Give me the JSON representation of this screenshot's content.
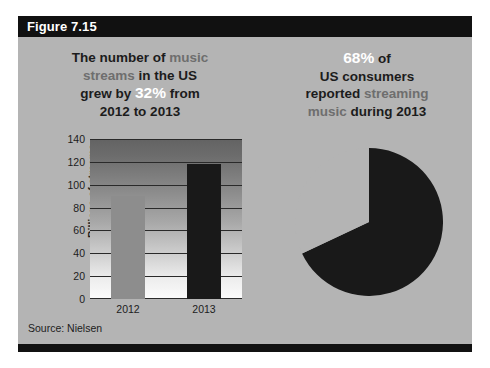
{
  "figure": {
    "label": "Figure 7.15",
    "source": "Source: Nielsen",
    "background_color": "#b4b4b4",
    "bar_color": "#111111"
  },
  "left_panel": {
    "headline_parts": [
      {
        "text": "The number of ",
        "style": "bold-dark"
      },
      {
        "text": "music",
        "style": "muted"
      },
      {
        "text": "streams",
        "style": "muted"
      },
      {
        "text": " in the US",
        "style": "bold-dark"
      },
      {
        "text": "grew by ",
        "style": "bold-dark"
      },
      {
        "text": "32%",
        "style": "white-big"
      },
      {
        "text": " from",
        "style": "bold-dark"
      },
      {
        "text": "2012 to 2013",
        "style": "bold-dark"
      }
    ],
    "headline_text": "The number of music streams in the US grew by 32% from 2012 to 2013",
    "highlight_value": "32%",
    "highlight_color": "#ffffff"
  },
  "right_panel": {
    "headline_parts": [
      {
        "text": "68%",
        "style": "white-big"
      },
      {
        "text": " of",
        "style": "bold-dark"
      },
      {
        "text": "US consumers",
        "style": "bold-dark"
      },
      {
        "text": "reported ",
        "style": "bold-dark"
      },
      {
        "text": "streaming",
        "style": "muted"
      },
      {
        "text": "music",
        "style": "muted"
      },
      {
        "text": " during 2013",
        "style": "bold-dark"
      }
    ],
    "headline_text": "68% of US consumers reported streaming music during 2013",
    "highlight_value": "68%",
    "highlight_color": "#ffffff"
  },
  "chart_data": [
    {
      "type": "bar",
      "title": "",
      "categories": [
        "2012",
        "2013"
      ],
      "values": [
        90,
        118
      ],
      "xlabel": "",
      "ylabel": "Billions of streams",
      "ylim": [
        0,
        140
      ],
      "yticks": [
        0,
        20,
        40,
        60,
        80,
        100,
        120,
        140
      ],
      "ytick_labels": [
        "0",
        "20",
        "40",
        "60",
        "80",
        "100",
        "120",
        "140"
      ],
      "grid": true,
      "legend": "none",
      "series_colors": [
        "#8d8d8d",
        "#191919"
      ],
      "plot_background": "vertical-gradient-dark-to-white",
      "source": "Source: Nielsen"
    },
    {
      "type": "pie",
      "title": "68% of US consumers reported streaming music during 2013",
      "labels": [
        "Reported streaming music",
        "Did not"
      ],
      "values": [
        68,
        32
      ],
      "display_values": [
        "68%",
        "32%"
      ],
      "colors": [
        "#191919",
        "#b4b4b4"
      ],
      "start_angle_deg": 0,
      "legend": "none",
      "grid": false
    }
  ]
}
